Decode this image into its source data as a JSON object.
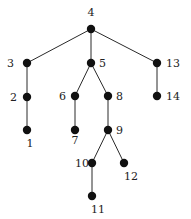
{
  "diagram": {
    "type": "tree",
    "root": "4",
    "colors": {
      "node": "#111111",
      "edge": "#2a2a2a",
      "label": "#222222",
      "background": "#ffffff"
    },
    "nodes": [
      {
        "id": "4",
        "label": "4",
        "x": 91,
        "y": 29,
        "lx": 91,
        "ly": 16,
        "anchor": "middle"
      },
      {
        "id": "3",
        "label": "3",
        "x": 27,
        "y": 63,
        "lx": 14,
        "ly": 67,
        "anchor": "end"
      },
      {
        "id": "5",
        "label": "5",
        "x": 91,
        "y": 63,
        "lx": 99,
        "ly": 67,
        "anchor": "start"
      },
      {
        "id": "13",
        "label": "13",
        "x": 157,
        "y": 63,
        "lx": 166,
        "ly": 67,
        "anchor": "start"
      },
      {
        "id": "2",
        "label": "2",
        "x": 27,
        "y": 97,
        "lx": 17,
        "ly": 101,
        "anchor": "end"
      },
      {
        "id": "6",
        "label": "6",
        "x": 75,
        "y": 96,
        "lx": 66,
        "ly": 100,
        "anchor": "end"
      },
      {
        "id": "8",
        "label": "8",
        "x": 108,
        "y": 96,
        "lx": 116,
        "ly": 100,
        "anchor": "start"
      },
      {
        "id": "14",
        "label": "14",
        "x": 157,
        "y": 96,
        "lx": 166,
        "ly": 100,
        "anchor": "start"
      },
      {
        "id": "1",
        "label": "1",
        "x": 27,
        "y": 130,
        "lx": 30,
        "ly": 147,
        "anchor": "middle"
      },
      {
        "id": "7",
        "label": "7",
        "x": 75,
        "y": 130,
        "lx": 75,
        "ly": 144,
        "anchor": "middle"
      },
      {
        "id": "9",
        "label": "9",
        "x": 108,
        "y": 130,
        "lx": 116,
        "ly": 134,
        "anchor": "start"
      },
      {
        "id": "10",
        "label": "10",
        "x": 92,
        "y": 163,
        "lx": 89,
        "ly": 167,
        "anchor": "end"
      },
      {
        "id": "12",
        "label": "12",
        "x": 124,
        "y": 163,
        "lx": 131,
        "ly": 180,
        "anchor": "middle"
      },
      {
        "id": "11",
        "label": "11",
        "x": 92,
        "y": 196,
        "lx": 98,
        "ly": 213,
        "anchor": "middle"
      }
    ],
    "edges": [
      [
        "4",
        "3"
      ],
      [
        "4",
        "5"
      ],
      [
        "4",
        "13"
      ],
      [
        "3",
        "2"
      ],
      [
        "2",
        "1"
      ],
      [
        "5",
        "6"
      ],
      [
        "5",
        "8"
      ],
      [
        "6",
        "7"
      ],
      [
        "8",
        "9"
      ],
      [
        "9",
        "10"
      ],
      [
        "9",
        "12"
      ],
      [
        "10",
        "11"
      ],
      [
        "13",
        "14"
      ]
    ]
  }
}
